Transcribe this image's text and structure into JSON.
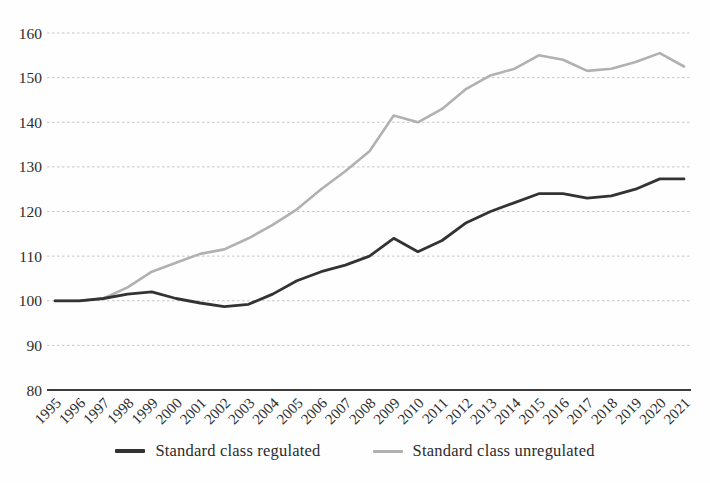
{
  "page": {
    "background_color": "#fefefe"
  },
  "chart_data": {
    "type": "line",
    "title": "",
    "xlabel": "",
    "ylabel": "",
    "x": [
      "1995",
      "1996",
      "1997",
      "1998",
      "1999",
      "2000",
      "2001",
      "2002",
      "2003",
      "2004",
      "2005",
      "2006",
      "2007",
      "2008",
      "2009",
      "2010",
      "2011",
      "2012",
      "2013",
      "2014",
      "2015",
      "2016",
      "2017",
      "2018",
      "2019",
      "2020",
      "2021"
    ],
    "series": [
      {
        "name": "Standard class regulated",
        "color": "#333333",
        "stroke_width": 2.8,
        "values": [
          100,
          100,
          100.5,
          101.5,
          102,
          100.5,
          99.5,
          98.7,
          99.2,
          101.5,
          104.5,
          106.5,
          108,
          110,
          114,
          111,
          113.5,
          117.5,
          120,
          122,
          124,
          124,
          123,
          123.5,
          125,
          127.3,
          127.3
        ]
      },
      {
        "name": "Standard class unregulated",
        "color": "#b1b1b1",
        "stroke_width": 2.6,
        "values": [
          100,
          100,
          100.5,
          103,
          106.5,
          108.5,
          110.5,
          111.5,
          114,
          117,
          120.5,
          125,
          129,
          133.5,
          141.5,
          140,
          143,
          147.5,
          150.5,
          152,
          155,
          154,
          151.5,
          152,
          153.5,
          155.5,
          152.5
        ]
      }
    ],
    "ylim": [
      80,
      160
    ],
    "yticks": [
      80,
      90,
      100,
      110,
      120,
      130,
      140,
      150,
      160
    ],
    "grid": "horizontal-dashed",
    "legend_position": "bottom-center",
    "styles": {
      "gridline_color": "#c6c6c6",
      "axis_line_color": "#3c3c3c",
      "tick_label_color": "#2d2d2d",
      "tick_font_size": 15.5,
      "x_tick_rotation_deg": -45
    }
  }
}
